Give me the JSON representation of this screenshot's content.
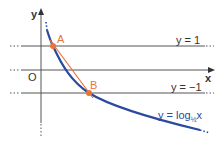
{
  "diagram": {
    "title": "",
    "axes": {
      "x_label": "x",
      "y_label": "y",
      "origin_label": "O"
    },
    "lines": [
      {
        "label": "y = 1",
        "y_value": 1
      },
      {
        "label": "y = −1",
        "y_value": -1
      }
    ],
    "curve": {
      "label_prefix": "y = log",
      "label_base": "1/2",
      "label_base_display": "½",
      "label_suffix": "x",
      "color": "#2a4aa0"
    },
    "points": [
      {
        "name": "A",
        "on": "y = 1",
        "color": "#e8743b"
      },
      {
        "name": "B",
        "on": "y = −1",
        "color": "#e8743b"
      }
    ],
    "segment": {
      "from": "A",
      "to": "B",
      "color": "#e8743b"
    },
    "colors": {
      "axis": "#333333",
      "curve": "#2a4aa0",
      "accent": "#e8743b"
    }
  }
}
